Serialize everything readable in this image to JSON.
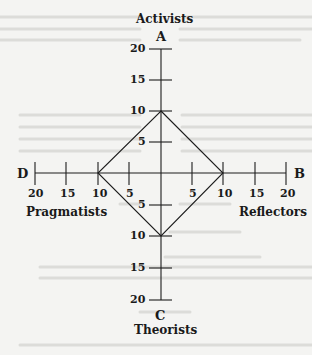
{
  "diagram": {
    "type": "learning-styles-quadrant",
    "axes": {
      "top": {
        "letter": "A",
        "name": "Activists"
      },
      "right": {
        "letter": "B",
        "name": "Reflectors"
      },
      "bottom": {
        "letter": "C",
        "name": "Theorists"
      },
      "left": {
        "letter": "D",
        "name": "Pragmatists"
      }
    },
    "tick_labels": {
      "top": [
        "20",
        "15",
        "10",
        "5"
      ],
      "bottom": [
        "5",
        "10",
        "15",
        "20"
      ],
      "left": [
        "20",
        "15",
        "10",
        "5"
      ],
      "right": [
        "5",
        "10",
        "15",
        "20"
      ]
    },
    "plotted_scores": {
      "activist": 10,
      "reflector": 10,
      "theorist": 10,
      "pragmatist": 10
    },
    "colors": {
      "ink": "#1c1c1c",
      "paper": "#f4f4f2",
      "show_through": "#d9d9d6"
    }
  }
}
